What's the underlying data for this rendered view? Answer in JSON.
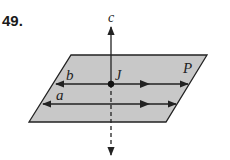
{
  "problem_number": "49.",
  "labels": {
    "plane": "P",
    "line_b": "b",
    "line_a": "a",
    "line_c": "c",
    "point": "J"
  },
  "colors": {
    "plane_fill": "#c8c8c8",
    "stroke": "#222222",
    "background": "#ffffff"
  }
}
